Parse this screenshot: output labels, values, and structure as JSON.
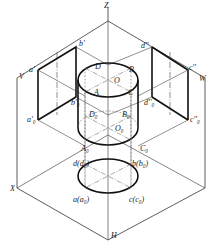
{
  "figure": {
    "axes": {
      "z": "Z",
      "x": "X",
      "h": "H",
      "v": "V",
      "w": "W"
    },
    "labels": [
      {
        "id": "Z",
        "text": "Z",
        "x": 104,
        "y": 2
      },
      {
        "id": "V",
        "text": "V",
        "x": 19,
        "y": 73
      },
      {
        "id": "W",
        "text": "W",
        "x": 199,
        "y": 75
      },
      {
        "id": "X",
        "text": "X",
        "x": 10,
        "y": 185
      },
      {
        "id": "H",
        "text": "H",
        "x": 111,
        "y": 232
      },
      {
        "id": "a-prime",
        "text": "a'",
        "x": 29,
        "y": 66
      },
      {
        "id": "b-prime",
        "text": "b'",
        "x": 79,
        "y": 40
      },
      {
        "id": "a-prime-0",
        "text": "a'₀",
        "x": 27,
        "y": 116
      },
      {
        "id": "b-prime-0",
        "text": "b'₀",
        "x": 71,
        "y": 99
      },
      {
        "id": "d-dprime",
        "text": "d''",
        "x": 141,
        "y": 42
      },
      {
        "id": "c-dprime",
        "text": "c''",
        "x": 189,
        "y": 64
      },
      {
        "id": "d-dprime-0",
        "text": "d''₀",
        "x": 144,
        "y": 99
      },
      {
        "id": "c-dprime-0",
        "text": "c''₀",
        "x": 190,
        "y": 116
      },
      {
        "id": "D",
        "text": "D",
        "x": 95,
        "y": 63
      },
      {
        "id": "B",
        "text": "B",
        "x": 129,
        "y": 66
      },
      {
        "id": "O",
        "text": "O",
        "x": 114,
        "y": 77
      },
      {
        "id": "A",
        "text": "A",
        "x": 94,
        "y": 89
      },
      {
        "id": "C",
        "text": "C",
        "x": 128,
        "y": 89
      },
      {
        "id": "D0",
        "text": "D₀",
        "x": 89,
        "y": 111
      },
      {
        "id": "B0",
        "text": "B₀",
        "x": 122,
        "y": 111
      },
      {
        "id": "O0",
        "text": "O₀",
        "x": 115,
        "y": 125
      },
      {
        "id": "A0",
        "text": "A₀",
        "x": 81,
        "y": 145
      },
      {
        "id": "C0",
        "text": "C₀",
        "x": 140,
        "y": 145
      },
      {
        "id": "d-d0",
        "text": "d(d₀)",
        "x": 73,
        "y": 160
      },
      {
        "id": "b-b0",
        "text": "b(b₀)",
        "x": 132,
        "y": 160
      },
      {
        "id": "a-a0",
        "text": "a(a₀)",
        "x": 73,
        "y": 196
      },
      {
        "id": "c-c0",
        "text": "c(c₀)",
        "x": 129,
        "y": 196
      }
    ]
  }
}
